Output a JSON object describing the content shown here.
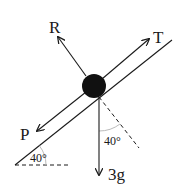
{
  "diagram": {
    "type": "force-diagram-inclined-plane",
    "incline_angle_label": "40°",
    "weight_angle_label": "40°",
    "forces": [
      {
        "name": "R",
        "label": "R",
        "direction": "perpendicular to plane, up-left"
      },
      {
        "name": "T",
        "label": "T",
        "direction": "up the plane"
      },
      {
        "name": "P",
        "label": "P",
        "direction": "down the plane"
      },
      {
        "name": "weight",
        "label": "3g",
        "direction": "vertically down"
      }
    ],
    "colors": {
      "ink": "#1a1a1a",
      "ball": "#111111",
      "background": "#ffffff",
      "arc": "#bbbbbb"
    }
  },
  "labels": {
    "R": "R",
    "T": "T",
    "P": "P",
    "weight": "3g",
    "angle_incline": "40°",
    "angle_weight": "40°"
  }
}
